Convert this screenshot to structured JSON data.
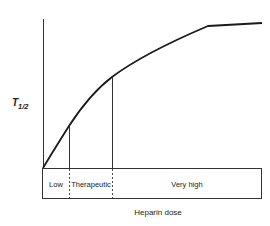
{
  "diagram": {
    "y_axis_label_main": "T",
    "y_axis_label_sub": "1/2",
    "x_axis_label": "Heparin dose",
    "zones": [
      {
        "label": "Low"
      },
      {
        "label": "Therapeutic"
      },
      {
        "label": "Very high"
      }
    ],
    "curve_description": "T1/2 rises steeply with dose, then plateaus at very high doses",
    "colors": {
      "line": "#1a1a1a",
      "background": "#ffffff"
    }
  }
}
